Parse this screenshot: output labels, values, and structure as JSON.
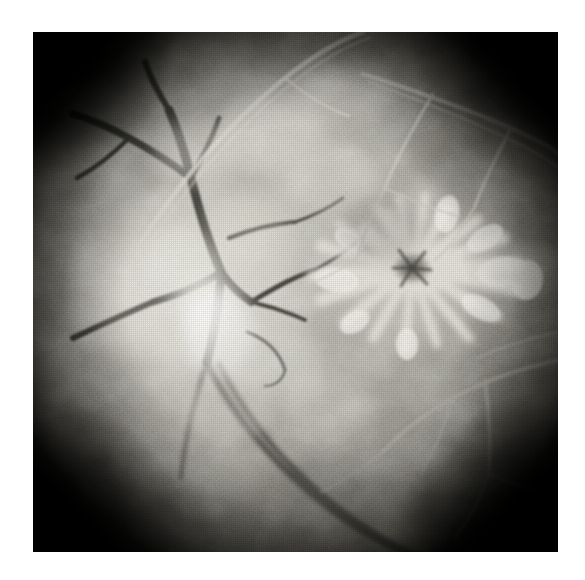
{
  "page": {
    "background_color": "#ffffff",
    "width": 585,
    "height": 580
  },
  "figure": {
    "name": "retinal-fluorescein-angiogram",
    "modality": "Fluorescein angiography",
    "color_mode": "grayscale",
    "plate": {
      "left": 33,
      "top": 32,
      "width": 525,
      "height": 520,
      "border_color": "#ffffff",
      "field_color": "#7d7d7d",
      "vignette_color": "#0b0b0b"
    },
    "tones": {
      "highlight": "#fbfaf6",
      "bright": "#e6e3da",
      "midtone": "#a8a69d",
      "shadow": "#4a4944",
      "dark_vessel": "#3c3b37",
      "light_vessel": "#d8d5cc",
      "corner_dark": "#121210"
    },
    "features": [
      {
        "name": "optic-disc-hyperfluorescence",
        "description": "Bright hyperfluorescent disc / leakage area, left of centre",
        "cx": 172,
        "cy": 272,
        "rx": 56,
        "ry": 78,
        "tone": "#fbfaf6"
      },
      {
        "name": "macular-star-lesion",
        "description": "Stellate petaloid radiating hyperfluorescence (macular star / cystoid macular oedema)",
        "cx": 412,
        "cy": 268,
        "rx": 98,
        "ry": 78,
        "center_tone": "#55534d",
        "petal_tone": "#f0ede4",
        "spoke_count": 22
      },
      {
        "name": "dark-vascular-tree-nasal",
        "description": "Dark branching retinal vessels entering from the left, converging near the disc",
        "tone": "#3c3b37"
      },
      {
        "name": "inferior-vessel-pair",
        "description": "Two dark vessels sweeping from the disc to lower centre / bottom edge",
        "tone": "#44433e"
      },
      {
        "name": "superior-arcade-light",
        "description": "Pale vessel arcing across the top-left toward upper centre",
        "tone": "#d8d5cc"
      },
      {
        "name": "temporal-arcade-light",
        "description": "Pale branching vessels across the upper-right quadrant",
        "tone": "#cfccc3"
      },
      {
        "name": "inferior-temporal-light-vessels",
        "description": "Pale vessels branching in the lower-right quadrant",
        "tone": "#b9b6ae"
      },
      {
        "name": "corner-vignette",
        "description": "Dark rounded vignette at the four corners of the circular fundus field"
      }
    ],
    "texture": {
      "grain": "film-grain",
      "screen": "halftone-dot-screen",
      "mottling": "choroidal-background-mottling"
    }
  }
}
